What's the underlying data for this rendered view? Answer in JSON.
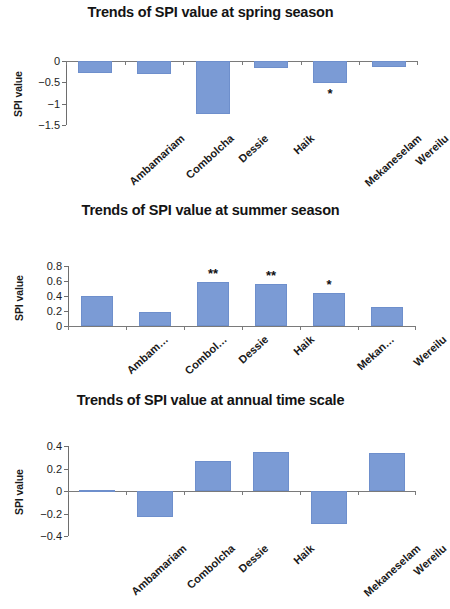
{
  "figure": {
    "axis_title": "SPI value",
    "bar_color": "#7b9bd5",
    "axis_color": "#7a7a7a"
  },
  "chart_data": [
    {
      "type": "bar",
      "id": "spring",
      "title": "Trends of SPI value at spring season",
      "xlabel": "",
      "ylabel": "SPI value",
      "categories": [
        "Ambamariam",
        "Combolcha",
        "Dessie",
        "Haik",
        "Mekaneselam",
        "Wereilu"
      ],
      "values": [
        -0.28,
        -0.31,
        -1.24,
        -0.16,
        -0.52,
        -0.14
      ],
      "annotations": [
        "",
        "",
        "",
        "",
        "*",
        ""
      ],
      "ylim": [
        -1.5,
        0
      ],
      "yticks": [
        0,
        -0.5,
        -1,
        -1.5
      ],
      "ytick_labels": [
        "0",
        "−0.5",
        "−1",
        "−1.5"
      ],
      "grid": false,
      "legend": "none"
    },
    {
      "type": "bar",
      "id": "summer",
      "title": "Trends of SPI value at summer season",
      "xlabel": "",
      "ylabel": "SPI value",
      "categories": [
        "Ambam…",
        "Combol…",
        "Dessie",
        "Haik",
        "Mekan…",
        "Wereilu"
      ],
      "values": [
        0.4,
        0.19,
        0.59,
        0.56,
        0.44,
        0.25
      ],
      "annotations": [
        "",
        "",
        "**",
        "**",
        "*",
        ""
      ],
      "ylim": [
        0,
        0.8
      ],
      "yticks": [
        0.8,
        0.6,
        0.4,
        0.2,
        0
      ],
      "ytick_labels": [
        "0.8",
        "0.6",
        "0.4",
        "0.2",
        "0"
      ],
      "grid": false,
      "legend": "none"
    },
    {
      "type": "bar",
      "id": "annual",
      "title": "Trends of SPI value at annual time scale",
      "xlabel": "",
      "ylabel": "SPI value",
      "categories": [
        "Ambamariam",
        "Combolcha",
        "Dessie",
        "Haik",
        "Mekaneselam",
        "Wereilu"
      ],
      "values": [
        0.01,
        -0.23,
        0.27,
        0.35,
        -0.29,
        0.34
      ],
      "annotations": [
        "",
        "",
        "",
        "",
        "",
        ""
      ],
      "ylim": [
        -0.4,
        0.4
      ],
      "yticks": [
        0.4,
        0.2,
        0,
        -0.2,
        -0.4
      ],
      "ytick_labels": [
        "0.4",
        "0.2",
        "0",
        "−0.2",
        "−0.4"
      ],
      "grid": false,
      "legend": "none"
    }
  ]
}
